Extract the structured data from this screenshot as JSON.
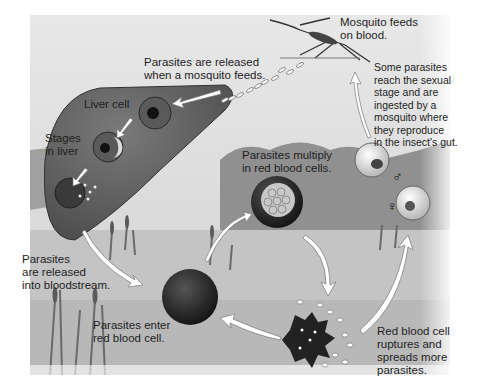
{
  "diagram": {
    "colors": {
      "background": "#ffffff",
      "sky": "#dcdcdc",
      "water": "#c8c8c8",
      "hills": "#8a8a8a",
      "liver": "#6a6a6a",
      "cell_dark": "#2a2a2a",
      "arrow": "#ffffff",
      "text": "#1e1e1e"
    },
    "labels": {
      "mosquito_feeds": "Mosquito feeds\non blood.",
      "released_when_feeds": "Parasites are released\nwhen a mosquito feeds.",
      "liver_cell": "Liver cell",
      "stages_in_liver": "Stages\nin liver",
      "sexual_stage": "Some parasites\nreach the sexual\nstage and are\ningested by a\nmosquito where\nthey reproduce\nin the insect's gut.",
      "multiply": "Parasites multiply\nin red blood cells.",
      "released_bloodstream": "Parasites\nare released\ninto bloodstream.",
      "enter_rbc": "Parasites enter\nred blood cell.",
      "rbc_ruptures": "Red blood cell\nruptures and\nspreads more\nparasites."
    },
    "symbols": {
      "male": "♂",
      "female": "♀"
    }
  }
}
